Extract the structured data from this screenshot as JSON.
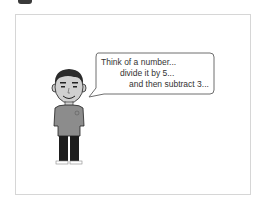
{
  "scene": {
    "speech_bubble": {
      "lines": [
        "Think of a number...",
        "divide it by 5...",
        "and then subtract 3..."
      ]
    },
    "character": "cartoon-boy",
    "colors": {
      "frame_border": "#d6d6d6",
      "bubble_border": "#6e6e6e",
      "hair": "#2b2b2b",
      "skin": "#d0d0d0",
      "shirt": "#8c8c8c",
      "pants": "#1e1e1e",
      "text": "#333333"
    }
  }
}
